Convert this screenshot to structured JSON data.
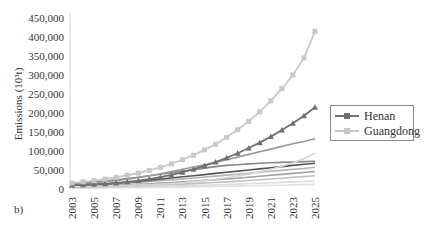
{
  "chart_data": {
    "type": "line",
    "title": "",
    "panel_label": "b)",
    "xlabel": "",
    "ylabel": "Emissions (10³t)",
    "ylim": [
      0,
      450000
    ],
    "yticks": [
      "0",
      "50,000",
      "100,000",
      "150,000",
      "200,000",
      "250,000",
      "300,000",
      "350,000",
      "400,000",
      "450,000"
    ],
    "xticks": [
      "2003",
      "2005",
      "2007",
      "2009",
      "2011",
      "2013",
      "2015",
      "2017",
      "2019",
      "2021",
      "2023",
      "2025"
    ],
    "x": [
      2003,
      2004,
      2005,
      2006,
      2007,
      2008,
      2009,
      2010,
      2011,
      2012,
      2013,
      2014,
      2015,
      2016,
      2017,
      2018,
      2019,
      2020,
      2021,
      2022,
      2023,
      2024,
      2025
    ],
    "grid": false,
    "legend_position": "right",
    "series": [
      {
        "name": "Guangdong",
        "color": "#c8c8c8",
        "marker": "square",
        "in_legend": true,
        "values": [
          16000,
          19000,
          22000,
          26000,
          31000,
          36000,
          42000,
          49000,
          57000,
          66000,
          77000,
          89000,
          103000,
          118000,
          136000,
          156000,
          178000,
          203000,
          232000,
          264000,
          300000,
          345000,
          415000
        ]
      },
      {
        "name": "Henan",
        "color": "#707070",
        "marker": "triangle",
        "in_legend": true,
        "values": [
          10000,
          11000,
          12500,
          14000,
          16000,
          19000,
          22000,
          26000,
          31000,
          37000,
          44000,
          52000,
          61000,
          71000,
          82000,
          94000,
          108000,
          122000,
          138000,
          155000,
          173000,
          193000,
          215000
        ]
      },
      {
        "name": "Province 3",
        "color": "#9a9a9a",
        "marker": "none",
        "in_legend": false,
        "values": [
          12000,
          14000,
          16000,
          19000,
          22000,
          26000,
          30000,
          35000,
          40000,
          46000,
          52000,
          58000,
          64000,
          70000,
          77000,
          84000,
          91000,
          98000,
          105000,
          112000,
          119000,
          125000,
          132000
        ]
      },
      {
        "name": "Province 4",
        "color": "#d5d5d5",
        "marker": "none",
        "in_legend": false,
        "values": [
          6000,
          6500,
          7000,
          7800,
          8600,
          9500,
          10500,
          11600,
          13000,
          14500,
          16500,
          19000,
          22000,
          25500,
          29500,
          34000,
          39000,
          45000,
          52000,
          60000,
          69000,
          80000,
          95000
        ]
      },
      {
        "name": "Province 5",
        "color": "#555555",
        "marker": "none",
        "in_legend": false,
        "values": [
          8000,
          9500,
          11000,
          13000,
          15000,
          17500,
          20000,
          23000,
          26000,
          29000,
          32000,
          35000,
          38000,
          41000,
          44000,
          47000,
          50000,
          53000,
          56000,
          59000,
          62000,
          65000,
          68000
        ]
      },
      {
        "name": "Province 6",
        "color": "#888888",
        "marker": "none",
        "in_legend": false,
        "values": [
          14000,
          16000,
          18500,
          21000,
          24000,
          27500,
          31000,
          35000,
          39000,
          43000,
          47000,
          51000,
          55000,
          59000,
          62000,
          64000,
          66000,
          67500,
          69000,
          70000,
          71000,
          72000,
          73000
        ]
      },
      {
        "name": "Province 7",
        "color": "#b5b5b5",
        "marker": "none",
        "in_legend": false,
        "values": [
          9000,
          10000,
          11000,
          12500,
          14000,
          16000,
          18000,
          20000,
          22000,
          24000,
          26500,
          29000,
          31500,
          34000,
          36500,
          39000,
          41500,
          44000,
          46500,
          49000,
          51500,
          54000,
          57000
        ]
      },
      {
        "name": "Province 8",
        "color": "#a0a0a0",
        "marker": "none",
        "in_legend": false,
        "values": [
          7000,
          7800,
          8600,
          9500,
          10500,
          11500,
          12700,
          14000,
          15500,
          17000,
          18800,
          20500,
          22500,
          24500,
          26500,
          28500,
          31000,
          33500,
          36000,
          38500,
          41000,
          43500,
          46000
        ]
      },
      {
        "name": "Province 9",
        "color": "#c0c0c0",
        "marker": "none",
        "in_legend": false,
        "values": [
          5000,
          5500,
          6000,
          6600,
          7300,
          8000,
          8800,
          9700,
          10700,
          11800,
          13000,
          14300,
          15700,
          17200,
          18800,
          20500,
          22300,
          24200,
          26200,
          28300,
          30500,
          32800,
          35000
        ]
      },
      {
        "name": "Province 10",
        "color": "#dcdcdc",
        "marker": "none",
        "in_legend": false,
        "values": [
          3000,
          3300,
          3600,
          4000,
          4400,
          4900,
          5400,
          6000,
          6700,
          7400,
          8200,
          9000,
          9900,
          10800,
          11800,
          12800,
          13900,
          15000,
          16200,
          17400,
          18600,
          19800,
          21000
        ]
      },
      {
        "name": "Province 11",
        "color": "#e2e2e2",
        "marker": "none",
        "in_legend": false,
        "values": [
          2000,
          2200,
          2400,
          2600,
          2900,
          3200,
          3500,
          3900,
          4300,
          4700,
          5100,
          5600,
          6100,
          6600,
          7100,
          7700,
          8300,
          8900,
          9500,
          10100,
          10800,
          11500,
          12000
        ]
      }
    ]
  },
  "legend": {
    "items": [
      {
        "label": "Henan",
        "color": "#707070"
      },
      {
        "label": "Guangdong",
        "color": "#c8c8c8"
      }
    ]
  }
}
